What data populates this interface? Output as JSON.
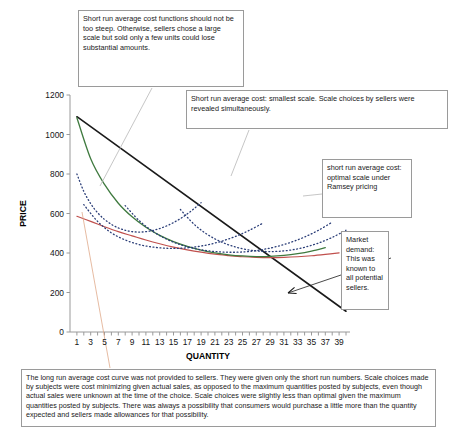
{
  "callouts": {
    "slope_note": "Short run average cost functions should not be too steep.  Otherwise, sellers chose a large scale but sold only a few units could lose substantial amounts.",
    "smallest_scale": "Short run average cost: smallest scale. Scale choices by sellers were revealed simultaneously.",
    "ramsey": "short run average cost: optimal scale under Ramsey pricing",
    "market_demand": "Market demand: This was known to all potential sellers.",
    "bottom_note": "The long run average cost curve was not provided to sellers.  They were given only the short run numbers.  Scale choices made by subjects were cost minimizing given actual sales, as opposed to the maximum quantities posted by subjects, even though actual sales were unknown at the time of the choice.  Scale choices were slightly less than optimal given the maximum quantities posted by subjects.  There was always a possibility that consumers would purchase a little more than the quantity expected and sellers made allowances for that possibility."
  },
  "chart_data": {
    "type": "line",
    "title": "",
    "xlabel": "QUANTITY",
    "ylabel": "PRICE",
    "xlim": [
      0,
      40
    ],
    "ylim": [
      0,
      1200
    ],
    "ytick_values": [
      0,
      200,
      400,
      600,
      800,
      1000,
      1200
    ],
    "xtick_values": [
      1,
      2,
      3,
      4,
      5,
      6,
      7,
      8,
      9,
      10,
      11,
      12,
      13,
      14,
      15,
      16,
      17,
      18,
      19,
      20,
      21,
      22,
      23,
      24,
      25,
      26,
      27,
      28,
      29,
      30,
      31,
      32,
      33,
      34,
      35,
      36,
      37,
      38,
      39,
      40
    ],
    "xtick_labels": [
      1,
      3,
      5,
      7,
      9,
      11,
      13,
      15,
      17,
      19,
      21,
      23,
      25,
      27,
      29,
      31,
      33,
      35,
      37,
      39
    ],
    "grid": false,
    "legend": "none",
    "series": [
      {
        "name": "market demand",
        "style": "solid",
        "color": "#1a1a1a",
        "width": 1.6,
        "x": [
          1,
          40
        ],
        "y": [
          1090,
          105
        ]
      },
      {
        "name": "long run average cost",
        "style": "solid",
        "color": "#c0504d",
        "width": 1.2,
        "x": [
          1,
          3,
          5,
          7,
          9,
          11,
          13,
          15,
          17,
          19,
          21,
          23,
          25,
          27,
          29,
          31,
          33,
          35,
          37,
          39
        ],
        "y": [
          586,
          560,
          533,
          508,
          487,
          466,
          447,
          430,
          416,
          404,
          394,
          387,
          381,
          378,
          377,
          378,
          381,
          386,
          393,
          401
        ]
      },
      {
        "name": "short run average cost: optimal scale under Ramsey pricing",
        "style": "solid",
        "color": "#3f7a3f",
        "width": 1.3,
        "x": [
          1,
          3,
          5,
          7,
          9,
          11,
          13,
          15,
          17,
          19,
          21,
          23,
          25,
          27,
          29,
          31,
          33,
          35,
          37
        ],
        "y": [
          1085,
          877,
          747,
          652,
          583,
          530,
          489,
          458,
          434,
          415,
          401,
          391,
          385,
          382,
          383,
          388,
          397,
          410,
          427
        ]
      },
      {
        "name": "short run average cost: smallest scale",
        "style": "dotted",
        "color": "#2b3e78",
        "width": 1.3,
        "x": [
          1,
          2,
          3,
          4,
          5,
          6,
          7,
          8,
          9,
          10,
          11,
          12,
          13,
          14,
          15,
          16,
          17,
          18,
          19
        ],
        "y": [
          800,
          712,
          650,
          604,
          570,
          545,
          527,
          515,
          508,
          506,
          508,
          514,
          524,
          537,
          554,
          574,
          598,
          625,
          655
        ]
      },
      {
        "name": "short run average cost: medium scale",
        "style": "dotted",
        "color": "#2b3e78",
        "width": 1.3,
        "x": [
          2,
          4,
          6,
          8,
          10,
          12,
          14,
          16,
          18,
          20,
          22,
          24,
          26,
          28
        ],
        "y": [
          645,
          560,
          502,
          466,
          443,
          430,
          424,
          424,
          430,
          442,
          460,
          484,
          515,
          552
        ]
      },
      {
        "name": "short run average cost: large scale",
        "style": "dotted",
        "color": "#2b3e78",
        "width": 1.3,
        "x": [
          8,
          10,
          12,
          14,
          16,
          18,
          20,
          22,
          24,
          26,
          28,
          30,
          32,
          34,
          36,
          38
        ],
        "y": [
          640,
          565,
          510,
          470,
          442,
          423,
          411,
          405,
          404,
          408,
          418,
          433,
          454,
          481,
          515,
          556
        ]
      },
      {
        "name": "short run average cost: largest scale",
        "style": "dotted",
        "color": "#2b3e78",
        "width": 1.3,
        "x": [
          16,
          18,
          20,
          22,
          24,
          26,
          28,
          30,
          32,
          34,
          36,
          38,
          40
        ],
        "y": [
          620,
          545,
          492,
          455,
          430,
          415,
          408,
          408,
          415,
          429,
          450,
          479,
          515
        ]
      }
    ],
    "annotations": [
      {
        "name": "demand-arrow",
        "from_px": [
          391,
          258
        ],
        "to_px": [
          288,
          293
        ],
        "color": "#1a1a1a"
      },
      {
        "name": "slope-leader",
        "from_px": [
          152,
          88
        ],
        "to_px": [
          100,
          186
        ],
        "color": "#b8b8b8"
      },
      {
        "name": "smallest-scale-leader",
        "from_px": [
          249,
          130
        ],
        "to_px": [
          231,
          176
        ],
        "color": "#b8b8b8"
      },
      {
        "name": "ramsey-leader",
        "from_px": [
          322,
          194
        ],
        "to_px": [
          303,
          196
        ],
        "color": "#b8b8b8"
      },
      {
        "name": "bottom-note-leader",
        "from_px": [
          110,
          368
        ],
        "to_px": [
          82,
          212
        ],
        "color": "#e0a98a"
      }
    ]
  }
}
